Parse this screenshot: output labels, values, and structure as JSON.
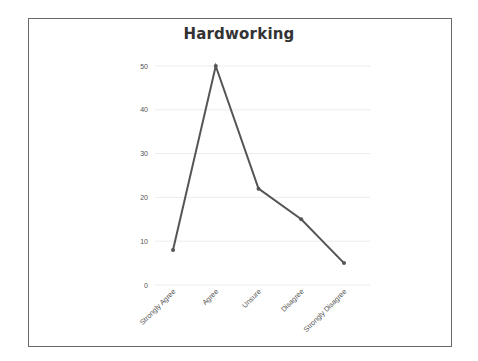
{
  "chart_data": {
    "type": "line",
    "title": "Hardworking",
    "xlabel": "",
    "ylabel": "",
    "categories": [
      "Strongly Agree",
      "Agree",
      "Unsure",
      "Disagree",
      "Strongly Disagree"
    ],
    "series": [
      {
        "name": "Hardworking",
        "values": [
          8,
          50,
          22,
          15,
          5
        ]
      }
    ],
    "ylim": [
      0,
      50
    ],
    "y_ticks": [
      0,
      10,
      20,
      30,
      40,
      50
    ],
    "grid": true,
    "legend": "none",
    "x_tick_rotation": -45,
    "line_color": "#555555",
    "grid_color": "#ececec"
  }
}
